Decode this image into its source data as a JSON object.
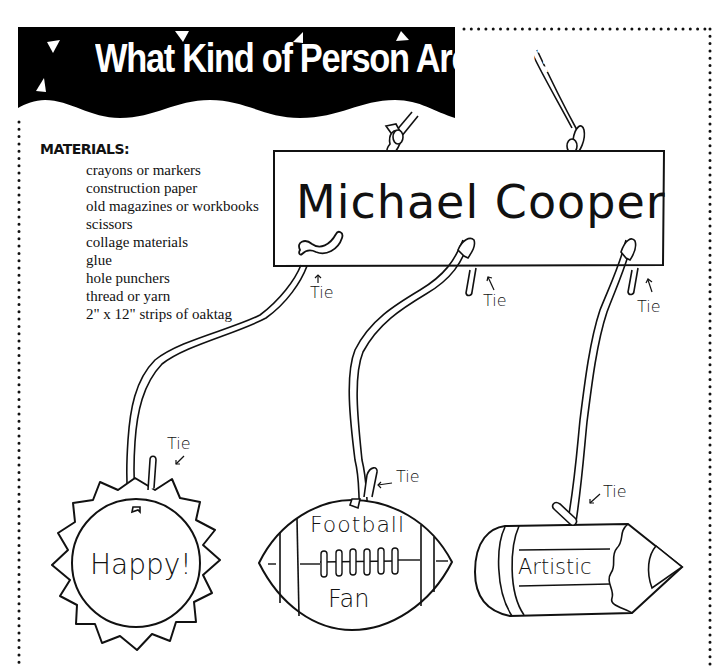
{
  "title": "What Kind of Person Are You?",
  "materials": {
    "heading": "MATERIALS:",
    "items": [
      "crayons or markers",
      "construction paper",
      "old magazines or workbooks",
      "scissors",
      "collage materials",
      "glue",
      "hole punchers",
      "thread or yarn",
      "2\" x 12\" strips of oaktag"
    ]
  },
  "mobile": {
    "sign_name": "Michael Cooper",
    "tie_label": "Tie",
    "tie_labels": [
      "Tie",
      "Tie",
      "Tie",
      "Tie",
      "Tie",
      "Tie"
    ],
    "hanging_shapes": [
      {
        "shape": "sun",
        "label": "Happy!"
      },
      {
        "shape": "football",
        "label_top": "Football",
        "label_bottom": "Fan"
      },
      {
        "shape": "pencil",
        "label": "Artistic"
      }
    ]
  },
  "colors": {
    "ink": "#111111",
    "banner": "#000000",
    "paper": "#ffffff"
  }
}
